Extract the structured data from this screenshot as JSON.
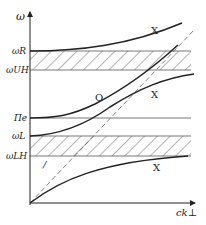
{
  "diagram": {
    "axes": {
      "y_label": "ω",
      "x_label": "ck⊥"
    },
    "levels": [
      {
        "id": "omega_R",
        "label": "ωR"
      },
      {
        "id": "omega_UH",
        "label": "ωUH"
      },
      {
        "id": "Pi_e",
        "label": "Πe"
      },
      {
        "id": "omega_L",
        "label": "ωL"
      },
      {
        "id": "omega_LH",
        "label": "ωLH"
      }
    ],
    "curve_labels": {
      "x_upper": "X",
      "o_mode": "O",
      "x_middle": "X",
      "x_lower": "X",
      "slope_marker": "/"
    },
    "colors": {
      "line": "#222222",
      "hatch": "#444444",
      "dashed": "#666666"
    }
  }
}
